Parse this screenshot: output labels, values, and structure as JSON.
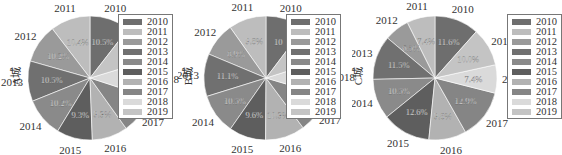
{
  "chart_data": [
    {
      "type": "pie",
      "title": "",
      "ylabel": "A城",
      "categories": [
        "2010",
        "2011",
        "2012",
        "2013",
        "2014",
        "2015",
        "2016",
        "2017",
        "2018",
        "2019"
      ],
      "values": [
        10.5,
        10.4,
        10.2,
        10.5,
        10.2,
        9.3,
        9.3,
        10.1,
        9.7,
        9.8
      ],
      "labels_visible": [
        "10.5%",
        "10.4%",
        "10.2%",
        "10.5%",
        "10.2%",
        "9.3%",
        "9.3%",
        "",
        "",
        ""
      ],
      "legend_position": "right-overlapping"
    },
    {
      "type": "pie",
      "title": "",
      "ylabel": "B城",
      "categories": [
        "2010",
        "2011",
        "2012",
        "2013",
        "2014",
        "2015",
        "2016",
        "2017",
        "2018",
        "2019"
      ],
      "values": [
        10.3,
        9.8,
        8.9,
        11.1,
        10.5,
        9.6,
        10.3,
        10.2,
        9.5,
        9.8
      ],
      "labels_visible": [
        "10",
        "9.8%",
        "8.9%",
        "11.1%",
        "10.5%",
        "9.6%",
        "10.3%",
        "",
        "",
        ""
      ],
      "legend_position": "right-overlapping"
    },
    {
      "type": "pie",
      "title": "",
      "ylabel": "C城",
      "categories": [
        "2010",
        "2011",
        "2012",
        "2013",
        "2014",
        "2015",
        "2016",
        "2017",
        "2018",
        "2019"
      ],
      "values": [
        11.6,
        7.4,
        6.5,
        11.5,
        10.5,
        12.6,
        9.8,
        12.9,
        7.4,
        10.0
      ],
      "labels_visible": [
        "11.6%",
        "7.4%",
        "6.5%",
        "11.5%",
        "10.5%",
        "12.6%",
        "9.8%",
        "12.9%",
        "7.4%",
        "10.0%"
      ],
      "legend_position": "right"
    }
  ],
  "legend": {
    "items": [
      {
        "label": "2010",
        "color": "#6e6e6e"
      },
      {
        "label": "2011",
        "color": "#bdbdbd"
      },
      {
        "label": "2012",
        "color": "#9a9a9a"
      },
      {
        "label": "2013",
        "color": "#707070"
      },
      {
        "label": "2014",
        "color": "#8a8a8a"
      },
      {
        "label": "2015",
        "color": "#5e5e5e"
      },
      {
        "label": "2016",
        "color": "#b2b2b2"
      },
      {
        "label": "2017",
        "color": "#858585"
      },
      {
        "label": "2018",
        "color": "#dadada"
      },
      {
        "label": "2019",
        "color": "#c4c4c4"
      }
    ]
  },
  "panels": [
    {
      "ylabel": "A城"
    },
    {
      "ylabel": "B城"
    },
    {
      "ylabel": "C城"
    }
  ]
}
